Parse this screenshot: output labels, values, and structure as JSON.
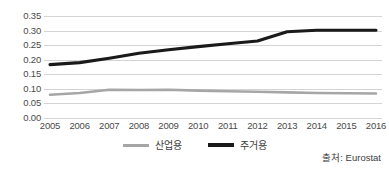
{
  "chart_data": {
    "type": "line",
    "title": "",
    "xlabel": "",
    "ylabel": "",
    "categories": [
      "2005",
      "2006",
      "2007",
      "2008",
      "2009",
      "2010",
      "2011",
      "2012",
      "2013",
      "2014",
      "2015",
      "2016"
    ],
    "series": [
      {
        "name": "산업용",
        "color": "#a6a6a6",
        "values": [
          0.08,
          0.086,
          0.097,
          0.096,
          0.097,
          0.094,
          0.092,
          0.09,
          0.088,
          0.086,
          0.085,
          0.084
        ]
      },
      {
        "name": "주거용",
        "color": "#1a1a1a",
        "values": [
          0.183,
          0.19,
          0.205,
          0.222,
          0.234,
          0.245,
          0.255,
          0.264,
          0.296,
          0.301,
          0.301,
          0.301
        ]
      }
    ],
    "ylim": [
      0.0,
      0.35
    ],
    "yticks": [
      "0.00",
      "0.05",
      "0.10",
      "0.15",
      "0.20",
      "0.25",
      "0.30",
      "0.35"
    ],
    "ytick_values": [
      0.0,
      0.05,
      0.1,
      0.15,
      0.2,
      0.25,
      0.3,
      0.35
    ],
    "grid": true,
    "legend_position": "bottom"
  },
  "legend": {
    "items": [
      {
        "label": "산업용"
      },
      {
        "label": "주거용"
      }
    ]
  },
  "source": {
    "text": "출처: Eurostat"
  },
  "colors": {
    "industrial": "#a6a6a6",
    "residential": "#1a1a1a",
    "gridline": "#d4d4d4",
    "tick_label": "#4a4a4a",
    "background": "#ffffff"
  }
}
